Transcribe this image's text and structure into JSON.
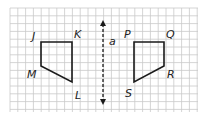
{
  "figure": {
    "type": "reflection",
    "line_label": "a",
    "grid": {
      "x0": 10,
      "y0": 8,
      "x1": 198,
      "y1": 112,
      "cell": 7.8,
      "color": "#c9c9c9"
    },
    "shapes": [
      {
        "name": "JKLM",
        "vertices": [
          {
            "label": "J",
            "x": 41,
            "y": 42
          },
          {
            "label": "K",
            "x": 72,
            "y": 42
          },
          {
            "label": "L",
            "x": 72,
            "y": 82
          },
          {
            "label": "M",
            "x": 41,
            "y": 66
          }
        ]
      },
      {
        "name": "PQRS",
        "vertices": [
          {
            "label": "P",
            "x": 134,
            "y": 42
          },
          {
            "label": "Q",
            "x": 164,
            "y": 42
          },
          {
            "label": "R",
            "x": 164,
            "y": 66
          },
          {
            "label": "S",
            "x": 134,
            "y": 82
          }
        ]
      }
    ],
    "labels": [
      {
        "text": "J",
        "x": 32,
        "y": 31
      },
      {
        "text": "K",
        "x": 74,
        "y": 29
      },
      {
        "text": "M",
        "x": 27,
        "y": 69
      },
      {
        "text": "L",
        "x": 75,
        "y": 90
      },
      {
        "text": "P",
        "x": 124,
        "y": 29
      },
      {
        "text": "Q",
        "x": 166,
        "y": 29
      },
      {
        "text": "R",
        "x": 167,
        "y": 69
      },
      {
        "text": "S",
        "x": 125,
        "y": 88
      },
      {
        "text": "a",
        "x": 109,
        "y": 36
      }
    ],
    "axis_line": {
      "x": 103,
      "y1": 20,
      "y2": 105
    }
  }
}
